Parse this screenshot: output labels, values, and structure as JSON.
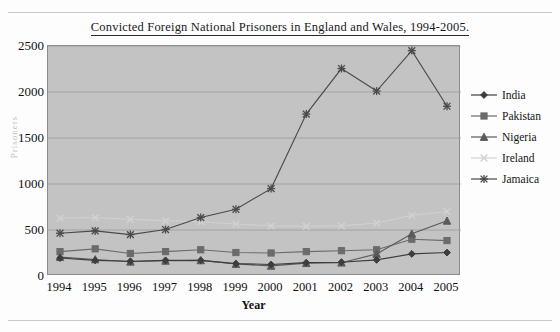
{
  "chart_data": {
    "type": "line",
    "title": "Convicted Foreign National Prisoners in England and Wales, 1994-2005.",
    "xlabel": "Year",
    "ylabel": "Prisoners",
    "categories": [
      "1994",
      "1995",
      "1996",
      "1997",
      "1998",
      "1999",
      "2000",
      "2001",
      "2002",
      "2003",
      "2004",
      "2005"
    ],
    "ylim": [
      0,
      2500
    ],
    "ytick_labels": [
      "0",
      "500",
      "1000",
      "1500",
      "2000",
      "2500"
    ],
    "ytick_values": [
      0,
      500,
      1000,
      1500,
      2000,
      2500
    ],
    "grid": "horizontal",
    "legend_position": "right",
    "series": [
      {
        "name": "India",
        "marker": "diamond",
        "color": "#3d3d3d",
        "values": [
          195,
          170,
          160,
          170,
          170,
          135,
          125,
          145,
          150,
          175,
          240,
          255
        ]
      },
      {
        "name": "Pakistan",
        "marker": "square",
        "color": "#6b6b6b",
        "values": [
          265,
          295,
          245,
          265,
          285,
          255,
          250,
          265,
          275,
          285,
          400,
          385
        ]
      },
      {
        "name": "Nigeria",
        "marker": "triangle",
        "color": "#5a5a5a",
        "values": [
          205,
          180,
          155,
          165,
          170,
          130,
          110,
          140,
          145,
          240,
          460,
          600
        ]
      },
      {
        "name": "Ireland",
        "marker": "cross",
        "color": "#d2d2d2",
        "values": [
          630,
          635,
          615,
          600,
          590,
          565,
          545,
          540,
          545,
          575,
          660,
          700
        ]
      },
      {
        "name": "Jamaica",
        "marker": "asterisk",
        "color": "#4a4a4a",
        "values": [
          465,
          490,
          450,
          505,
          635,
          725,
          950,
          1760,
          2255,
          2010,
          2450,
          1845
        ]
      }
    ]
  },
  "plot": {
    "background_color": "#c3c3c3",
    "gridline_color": "#9a9a9a",
    "border_color": "#8c8c8c"
  }
}
